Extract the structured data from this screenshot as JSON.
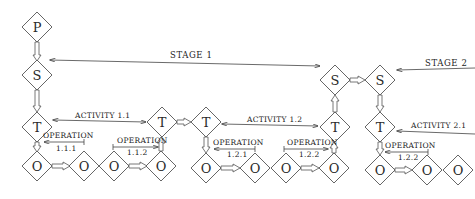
{
  "diagram": {
    "type": "hierarchical-process-flow",
    "nodes": [
      {
        "id": "P",
        "letter": "P",
        "x": 37,
        "y": 27
      },
      {
        "id": "S1",
        "letter": "S",
        "x": 37,
        "y": 75
      },
      {
        "id": "T1",
        "letter": "T",
        "x": 37,
        "y": 127
      },
      {
        "id": "O1",
        "letter": "O",
        "x": 37,
        "y": 166
      },
      {
        "id": "O2",
        "letter": "O",
        "x": 84,
        "y": 166
      },
      {
        "id": "O3",
        "letter": "O",
        "x": 114,
        "y": 166
      },
      {
        "id": "T2",
        "letter": "T",
        "x": 162,
        "y": 122
      },
      {
        "id": "O4",
        "letter": "O",
        "x": 161,
        "y": 166
      },
      {
        "id": "T3",
        "letter": "T",
        "x": 206,
        "y": 122
      },
      {
        "id": "O5",
        "letter": "O",
        "x": 206,
        "y": 168
      },
      {
        "id": "O6",
        "letter": "O",
        "x": 255,
        "y": 168
      },
      {
        "id": "O7",
        "letter": "O",
        "x": 286,
        "y": 168
      },
      {
        "id": "O8",
        "letter": "O",
        "x": 334,
        "y": 168
      },
      {
        "id": "T4",
        "letter": "T",
        "x": 335,
        "y": 127
      },
      {
        "id": "S2",
        "letter": "S",
        "x": 335,
        "y": 80
      },
      {
        "id": "S3",
        "letter": "S",
        "x": 380,
        "y": 80
      },
      {
        "id": "T5",
        "letter": "T",
        "x": 380,
        "y": 127
      },
      {
        "id": "O9",
        "letter": "O",
        "x": 380,
        "y": 170
      },
      {
        "id": "O10",
        "letter": "O",
        "x": 427,
        "y": 170
      },
      {
        "id": "O11",
        "letter": "O",
        "x": 458,
        "y": 170
      }
    ],
    "labels": {
      "stage1": "STAGE 1",
      "stage2": "STAGE 2",
      "activity_1_1": "ACTIVITY 1.1",
      "activity_1_2": "ACTIVITY 1.2",
      "activity_2_1": "ACTIVITY 2.1",
      "operation": "OPERATION",
      "op_1_1_1": "1.1.1",
      "op_1_1_2": "1.1.2",
      "op_1_2_1": "1.2.1",
      "op_1_2_2a": "1.2.2",
      "op_1_2_2b": "1.2.2"
    },
    "colors": {
      "stroke": "#555555",
      "text": "#222222",
      "background": "#ffffff"
    }
  }
}
